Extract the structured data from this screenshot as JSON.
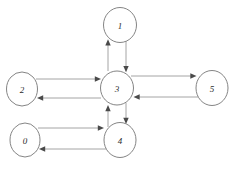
{
  "diagram": {
    "type": "directed-graph",
    "canvas": {
      "width": 235,
      "height": 173,
      "background": "#ffffff"
    },
    "style": {
      "node_stroke": "#767676",
      "node_fill": "#ffffff",
      "edge_stroke": "#8d8d8d",
      "arrow_fill": "#4a4a4a",
      "label_color": "#2b2b2b"
    },
    "nodes": [
      {
        "id": "1",
        "label": "1",
        "cx": 120,
        "cy": 25,
        "rx": 16.5,
        "ry": 17.5
      },
      {
        "id": "2",
        "label": "2",
        "cx": 22,
        "cy": 89,
        "rx": 15.5,
        "ry": 17.0
      },
      {
        "id": "3",
        "label": "3",
        "cx": 117,
        "cy": 88,
        "rx": 16.5,
        "ry": 17.0
      },
      {
        "id": "5",
        "label": "5",
        "cx": 212,
        "cy": 88,
        "rx": 16.0,
        "ry": 17.5
      },
      {
        "id": "0",
        "label": "0",
        "cx": 25,
        "cy": 140,
        "rx": 15.0,
        "ry": 17.0
      },
      {
        "id": "4",
        "label": "4",
        "cx": 120,
        "cy": 140,
        "rx": 16.0,
        "ry": 17.5
      }
    ],
    "edges": [
      {
        "from": "3",
        "to": "1",
        "direction": "up",
        "label": ""
      },
      {
        "from": "1",
        "to": "3",
        "direction": "down",
        "label": ""
      },
      {
        "from": "2",
        "to": "3",
        "direction": "right",
        "label": ""
      },
      {
        "from": "3",
        "to": "2",
        "direction": "left",
        "label": ""
      },
      {
        "from": "3",
        "to": "5",
        "direction": "right",
        "label": ""
      },
      {
        "from": "5",
        "to": "3",
        "direction": "left",
        "label": ""
      },
      {
        "from": "4",
        "to": "3",
        "direction": "up",
        "label": ""
      },
      {
        "from": "3",
        "to": "4",
        "direction": "down",
        "label": ""
      },
      {
        "from": "0",
        "to": "4",
        "direction": "right",
        "label": ""
      },
      {
        "from": "4",
        "to": "0",
        "direction": "left",
        "label": ""
      }
    ]
  }
}
